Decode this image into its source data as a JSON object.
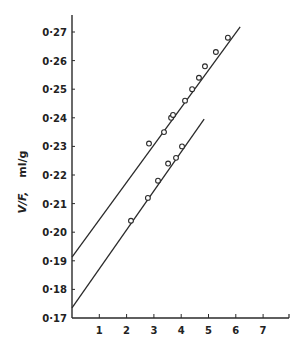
{
  "chart_data": {
    "type": "scatter",
    "title": "",
    "xlabel": "",
    "ylabel": "V/F,   ml/g",
    "ylabel_italic_part": "V/F,",
    "ylabel_units": "ml/g",
    "xlim": [
      0,
      7.9
    ],
    "ylim": [
      0.17,
      0.275
    ],
    "grid": false,
    "legend": null,
    "x_ticks": [
      1,
      2,
      3,
      4,
      5,
      6,
      7
    ],
    "x_tick_labels": [
      "1",
      "2",
      "3",
      "4",
      "5",
      "6",
      "7"
    ],
    "y_ticks": [
      0.17,
      0.18,
      0.19,
      0.2,
      0.21,
      0.22,
      0.23,
      0.24,
      0.25,
      0.26,
      0.27
    ],
    "y_tick_labels": [
      "0·17",
      "0·18",
      "0·19",
      "0·20",
      "0·21",
      "0·22",
      "0·23",
      "0·24",
      "0·25",
      "0·26",
      "0·27"
    ],
    "series": [
      {
        "name": "upper",
        "marker": "open-circle",
        "points": [
          [
            2.82,
            0.231
          ],
          [
            3.37,
            0.235
          ],
          [
            3.63,
            0.24
          ],
          [
            3.7,
            0.241
          ],
          [
            4.14,
            0.246
          ],
          [
            4.4,
            0.25
          ],
          [
            4.65,
            0.254
          ],
          [
            4.87,
            0.258
          ],
          [
            5.27,
            0.263
          ],
          [
            5.71,
            0.268
          ]
        ],
        "fit_line": {
          "x0": 0,
          "y0": 0.1913,
          "x1": 6.16,
          "y1": 0.2718
        }
      },
      {
        "name": "lower",
        "marker": "open-circle",
        "points": [
          [
            2.16,
            0.204
          ],
          [
            2.78,
            0.212
          ],
          [
            3.15,
            0.218
          ],
          [
            3.52,
            0.224
          ],
          [
            3.81,
            0.226
          ],
          [
            4.03,
            0.23
          ]
        ],
        "fit_line": {
          "x0": 0,
          "y0": 0.1735,
          "x1": 4.84,
          "y1": 0.2395
        }
      }
    ]
  },
  "layout": {
    "origin_px": [
      72,
      318
    ],
    "x_px_per_unit": 27.3,
    "y_px_per_unit": 2860,
    "axis_top_px": 15,
    "axis_right_px": 289,
    "ink_color": "#2a2a2a"
  }
}
